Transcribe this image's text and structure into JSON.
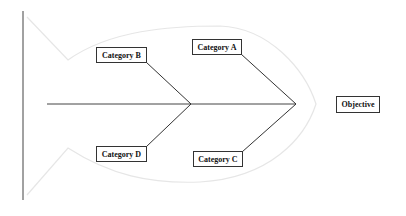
{
  "diagram": {
    "type": "fishbone",
    "objective": "Objective",
    "categories": [
      {
        "label": "Category A",
        "position": "top-right"
      },
      {
        "label": "Category B",
        "position": "top-left"
      },
      {
        "label": "Category C",
        "position": "bottom-right"
      },
      {
        "label": "Category D",
        "position": "bottom-left"
      }
    ],
    "colors": {
      "lines": "#333333",
      "fish_outline": "#e4e4e4",
      "background": "#ffffff"
    }
  }
}
